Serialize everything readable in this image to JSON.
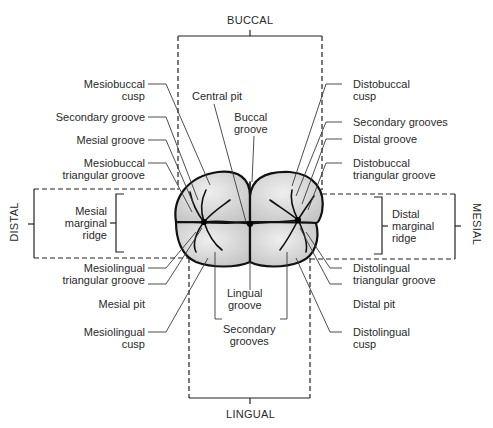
{
  "directions": {
    "top": "BUCCAL",
    "bottom": "LINGUAL",
    "left": "DISTAL",
    "right": "MESIAL"
  },
  "labels_left": [
    {
      "id": "mesiobuccal-cusp",
      "text": "Mesiobuccal\ncusp"
    },
    {
      "id": "secondary-groove",
      "text": "Secondary groove"
    },
    {
      "id": "mesial-groove",
      "text": "Mesial groove"
    },
    {
      "id": "mesiobuccal-triangular-groove",
      "text": "Mesiobuccal\ntriangular groove"
    },
    {
      "id": "mesial-marginal-ridge",
      "text": "Mesial\nmarginal\nridge"
    },
    {
      "id": "mesiolingual-triangular-groove",
      "text": "Mesiolingual\ntriangular groove"
    },
    {
      "id": "mesial-pit",
      "text": "Mesial pit"
    },
    {
      "id": "mesiolingual-cusp",
      "text": "Mesiolingual\ncusp"
    }
  ],
  "labels_right": [
    {
      "id": "distobuccal-cusp",
      "text": "Distobuccal\ncusp"
    },
    {
      "id": "secondary-grooves-right",
      "text": "Secondary grooves"
    },
    {
      "id": "distal-groove",
      "text": "Distal groove"
    },
    {
      "id": "distobuccal-triangular-groove",
      "text": "Distobuccal\ntriangular groove"
    },
    {
      "id": "distal-marginal-ridge",
      "text": "Distal\nmarginal\nridge"
    },
    {
      "id": "distolingual-triangular-groove",
      "text": "Distolingual\ntriangular groove"
    },
    {
      "id": "distal-pit",
      "text": "Distal pit"
    },
    {
      "id": "distolingual-cusp",
      "text": "Distolingual\ncusp"
    }
  ],
  "labels_center": [
    {
      "id": "central-pit",
      "text": "Central pit"
    },
    {
      "id": "buccal-groove",
      "text": "Buccal\ngroove"
    },
    {
      "id": "lingual-groove",
      "text": "Lingual\ngroove"
    },
    {
      "id": "secondary-grooves-bottom",
      "text": "Secondary\ngrooves"
    }
  ],
  "colors": {
    "tooth_fill": "#d6d6d6",
    "tooth_outline": "#111111",
    "leader": "#3a3a3a",
    "text": "#2a2a2a"
  }
}
